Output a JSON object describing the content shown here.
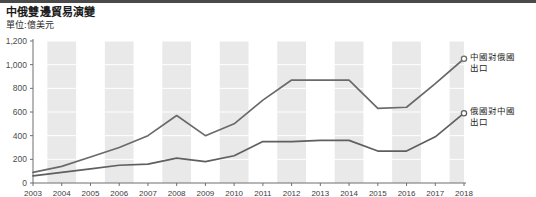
{
  "header": {
    "title": "中俄雙邊貿易演變",
    "subtitle": "單位:億美元"
  },
  "colors": {
    "line_china_exports": "#6a6a6a",
    "line_russia_exports": "#5f5f5f",
    "band": "#e9e9e9",
    "axis": "#6f6f6f",
    "text": "#1b1b1b",
    "top_rule": "#4a4a4a"
  },
  "chart_data": {
    "type": "line",
    "title": "中俄雙邊貿易演變",
    "subtitle": "單位:億美元",
    "xlabel": "",
    "ylabel": "億美元",
    "ylim": [
      0,
      1200
    ],
    "yticks": [
      0,
      200,
      400,
      600,
      800,
      1000,
      1200
    ],
    "ytick_labels": [
      "0",
      "200",
      "400",
      "600",
      "800",
      "1,000",
      "1,200"
    ],
    "grid": true,
    "legend_position": "right-inline",
    "categories": [
      "2003",
      "2004",
      "2005",
      "2006",
      "2007",
      "2008",
      "2009",
      "2010",
      "2011",
      "2012",
      "2013",
      "2014",
      "2015",
      "2016",
      "2017",
      "2018"
    ],
    "series": [
      {
        "name": "中國對俄國出口",
        "label_line1": "中國對俄國",
        "label_line2": "出口",
        "color": "#6a6a6a",
        "values": [
          90,
          140,
          220,
          300,
          400,
          570,
          400,
          500,
          700,
          870,
          870,
          870,
          630,
          640,
          840,
          1050
        ]
      },
      {
        "name": "俄國對中國出口",
        "label_line1": "俄國對中國",
        "label_line2": "出口",
        "color": "#5f5f5f",
        "values": [
          60,
          90,
          120,
          150,
          160,
          210,
          180,
          230,
          350,
          350,
          360,
          360,
          270,
          270,
          390,
          590
        ]
      }
    ]
  }
}
